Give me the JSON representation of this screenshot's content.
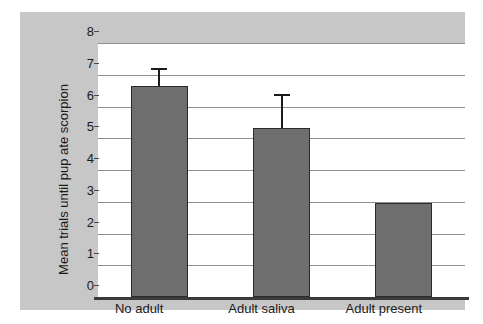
{
  "chart_data": {
    "type": "bar",
    "title": "",
    "subtitle": "",
    "xlabel": "",
    "ylabel": "Mean trials until pup ate scorpion",
    "categories": [
      "No adult",
      "Adult saliva",
      "Adult present"
    ],
    "values": [
      6.65,
      5.32,
      2.96
    ],
    "errors": [
      0.55,
      1.08,
      null
    ],
    "ylim": [
      0,
      8
    ],
    "ytick_labels": [
      "0",
      "1",
      "2",
      "3",
      "4",
      "5",
      "6",
      "7",
      "8"
    ],
    "ytick_values": [
      0,
      1,
      2,
      3,
      4,
      5,
      6,
      7,
      8
    ],
    "grid": true,
    "legend": false,
    "legend_position": "none",
    "series": [
      {
        "name": "Mean trials until pup ate scorpion",
        "values": [
          6.65,
          5.32,
          2.96
        ],
        "errors": [
          0.55,
          1.08,
          null
        ]
      }
    ],
    "annotations": []
  },
  "style": {
    "bar_fill": "#6e6e6e",
    "bar_edge": "#2b2b2b",
    "frame_background": "#c7c7c7",
    "plot_background": "#ffffff",
    "gridline_color": "#8f8f8f",
    "axis_color": "#3a3a3a",
    "text_color": "#1a1a1a"
  }
}
